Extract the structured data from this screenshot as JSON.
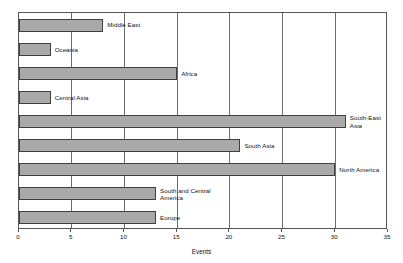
{
  "chart_data": {
    "type": "bar",
    "orientation": "horizontal",
    "title": "",
    "xlabel": "Events",
    "ylabel": "",
    "xlim": [
      0,
      35
    ],
    "xticks": [
      0,
      5,
      10,
      15,
      20,
      25,
      30,
      35
    ],
    "xtick_labels": [
      "0",
      "5",
      "10",
      "15",
      "20",
      "25",
      "30",
      "35"
    ],
    "grid": true,
    "grid_axis": "x",
    "legend": false,
    "categories": [
      "Middle East",
      "Oceania",
      "Africa",
      "Central Asia",
      "South-East Asia",
      "South Asia",
      "North America",
      "South and Central America",
      "Europe"
    ],
    "values": [
      8,
      3,
      15,
      3,
      31,
      21,
      30,
      13,
      13
    ],
    "bars": [
      {
        "label": "Middle East",
        "label_display": "Middle East",
        "value": 8
      },
      {
        "label": "Oceania",
        "label_display": "Oceania",
        "value": 3
      },
      {
        "label": "Africa",
        "label_display": "Africa",
        "value": 15
      },
      {
        "label": "Central Asia",
        "label_display": "Central Asia",
        "value": 3
      },
      {
        "label": "South-East Asia",
        "label_display": "South-East\nAsia",
        "value": 31
      },
      {
        "label": "South Asia",
        "label_display": "South Asia",
        "value": 21
      },
      {
        "label": "North America",
        "label_display": "North America",
        "value": 30
      },
      {
        "label": "South and Central America",
        "label_display": "South and Central\nAmerica",
        "value": 13
      },
      {
        "label": "Europe",
        "label_display": "Europe",
        "value": 13
      }
    ],
    "colors": {
      "bar_fill": "#a9a9a9",
      "bar_border": "#404040",
      "gridline": "#6b6b6b",
      "frame": "#555555",
      "text": "#111111",
      "background": "#ffffff"
    }
  }
}
